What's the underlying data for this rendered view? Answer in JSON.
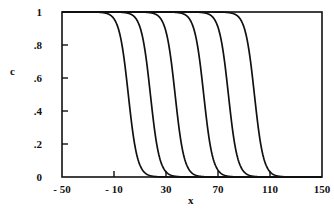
{
  "chart_data": {
    "type": "line",
    "title": "",
    "xlabel": "x",
    "ylabel": "c",
    "xlim": [
      -50,
      150
    ],
    "ylim": [
      0,
      1
    ],
    "x_ticks": [
      -50,
      -10,
      30,
      70,
      110,
      150
    ],
    "x_tick_labels": [
      "- 50",
      "- 10",
      "30",
      "70",
      "110",
      "150"
    ],
    "y_ticks": [
      0,
      0.2,
      0.4,
      0.6,
      0.8,
      1
    ],
    "y_tick_labels": [
      "0",
      ".2",
      ".4",
      ".6",
      ".8",
      "1"
    ],
    "grid": false,
    "legend": null,
    "line_color": "#111111",
    "note": "Curve points are sampled from a fitted logistic model c = 1/(1+exp((x-x0)/s)) with s=3.5 and midpoints estimated from the figure; they are approximations, not digitized values.",
    "series": [
      {
        "name": "curve 1",
        "midpoint_x": 1,
        "steepness": 3.5,
        "points": [
          [
            -50,
            1
          ],
          [
            -10,
            0.96
          ],
          [
            -5,
            0.85
          ],
          [
            0,
            0.57
          ],
          [
            1,
            0.5
          ],
          [
            5,
            0.24
          ],
          [
            10,
            0.07
          ],
          [
            20,
            0.005
          ],
          [
            150,
            0
          ]
        ]
      },
      {
        "name": "curve 2",
        "midpoint_x": 18,
        "steepness": 3.5,
        "points": [
          [
            -50,
            1
          ],
          [
            8,
            0.95
          ],
          [
            13,
            0.81
          ],
          [
            18,
            0.5
          ],
          [
            23,
            0.19
          ],
          [
            28,
            0.05
          ],
          [
            38,
            0.003
          ],
          [
            150,
            0
          ]
        ]
      },
      {
        "name": "curve 3",
        "midpoint_x": 37,
        "steepness": 3.5,
        "points": [
          [
            -50,
            1
          ],
          [
            27,
            0.95
          ],
          [
            32,
            0.81
          ],
          [
            37,
            0.5
          ],
          [
            42,
            0.19
          ],
          [
            47,
            0.05
          ],
          [
            57,
            0.003
          ],
          [
            150,
            0
          ]
        ]
      },
      {
        "name": "curve 4",
        "midpoint_x": 59,
        "steepness": 3.5,
        "points": [
          [
            -50,
            1
          ],
          [
            49,
            0.95
          ],
          [
            54,
            0.81
          ],
          [
            59,
            0.5
          ],
          [
            64,
            0.19
          ],
          [
            69,
            0.05
          ],
          [
            79,
            0.003
          ],
          [
            150,
            0
          ]
        ]
      },
      {
        "name": "curve 5",
        "midpoint_x": 78,
        "steepness": 3.5,
        "points": [
          [
            -50,
            1
          ],
          [
            68,
            0.95
          ],
          [
            73,
            0.81
          ],
          [
            78,
            0.5
          ],
          [
            83,
            0.19
          ],
          [
            88,
            0.05
          ],
          [
            98,
            0.003
          ],
          [
            150,
            0
          ]
        ]
      },
      {
        "name": "curve 6",
        "midpoint_x": 98,
        "steepness": 3.5,
        "points": [
          [
            -50,
            1
          ],
          [
            88,
            0.95
          ],
          [
            93,
            0.81
          ],
          [
            98,
            0.5
          ],
          [
            103,
            0.19
          ],
          [
            108,
            0.05
          ],
          [
            118,
            0.003
          ],
          [
            150,
            0
          ]
        ]
      }
    ]
  }
}
